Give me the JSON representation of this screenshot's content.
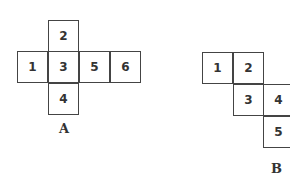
{
  "nets": [
    {
      "label": "A",
      "cells": [
        {
          "n": "2",
          "x": 48,
          "y": 20
        },
        {
          "n": "1",
          "x": 17,
          "y": 51
        },
        {
          "n": "3",
          "x": 48,
          "y": 51
        },
        {
          "n": "5",
          "x": 79,
          "y": 51
        },
        {
          "n": "6",
          "x": 110,
          "y": 51
        },
        {
          "n": "4",
          "x": 48,
          "y": 83
        }
      ],
      "label_pos": {
        "x": 59,
        "y": 121
      }
    },
    {
      "label": "B",
      "cells": [
        {
          "n": "1",
          "x": 202,
          "y": 52
        },
        {
          "n": "2",
          "x": 233,
          "y": 52
        },
        {
          "n": "3",
          "x": 233,
          "y": 84
        },
        {
          "n": "4",
          "x": 263,
          "y": 84
        },
        {
          "n": "5",
          "x": 263,
          "y": 116
        }
      ],
      "label_pos": {
        "x": 271,
        "y": 161
      }
    }
  ]
}
